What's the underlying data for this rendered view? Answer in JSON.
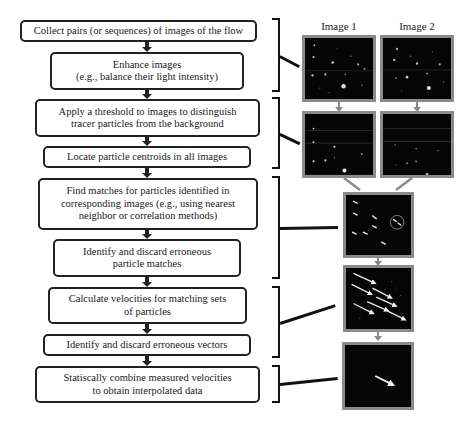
{
  "steps": [
    {
      "id": "collect",
      "text": "Collect pairs (or sequences) of images of the flow"
    },
    {
      "id": "enhance",
      "text": "Enhance images\n(e.g., balance their light intensity)"
    },
    {
      "id": "threshold",
      "text": "Apply a threshold to images to distinguish\ntracer particles from the background"
    },
    {
      "id": "locate",
      "text": "Locate particle centroids in all images"
    },
    {
      "id": "match",
      "text": "Find matches for particles identified in\ncorresponding images (e.g., using nearest\nneighbor or correlation methods)"
    },
    {
      "id": "discard-matches",
      "text": "Identify and discard erroneous\nparticle matches"
    },
    {
      "id": "velocities",
      "text": "Calculate velocities for matching sets\nof particles"
    },
    {
      "id": "discard-vectors",
      "text": "Identify and discard erroneous vectors"
    },
    {
      "id": "combine",
      "text": "Statiscally combine measured velocities\nto obtain interpolated data"
    }
  ],
  "images": {
    "image1_label": "Image 1",
    "image2_label": "Image 2"
  },
  "colors": {
    "box_border": "#222222",
    "panel_border": "#8a8a8a",
    "panel_bg": "#050505",
    "connector_gray": "#8a8a8a"
  }
}
